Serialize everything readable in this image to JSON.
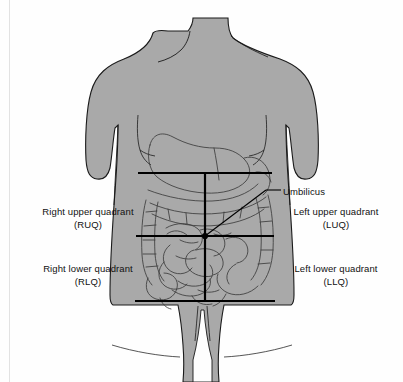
{
  "labels": {
    "umbilicus": "Umbilicus",
    "right_upper_quadrant": {
      "name": "Right upper quadrant",
      "abbrev": "(RUQ)"
    },
    "left_upper_quadrant": {
      "name": "Left upper quadrant",
      "abbrev": "(LUQ)"
    },
    "right_lower_quadrant": {
      "name": "Right lower quadrant",
      "abbrev": "(RLQ)"
    },
    "left_lower_quadrant": {
      "name": "Left lower quadrant",
      "abbrev": "(LLQ)"
    }
  },
  "colors": {
    "background": "#fefefe",
    "body_fill": "#a9a9a9",
    "body_outline": "#1a1a1a",
    "viscera_line": "#3a3a3a",
    "quadrant_line": "#000000",
    "label_text": "#111111",
    "scan_edge": "#e2e2e2"
  },
  "geometry": {
    "canvas_width": 403,
    "canvas_height": 382,
    "vertical_midline_x": 205,
    "top_horizontal_line_y": 173,
    "umbilical_horizontal_line_y": 236,
    "bottom_horizontal_line_y": 301,
    "umbilicus_point": [
      205,
      236
    ],
    "quadrant_band_left_x": 138,
    "quadrant_band_right_x": 272
  }
}
